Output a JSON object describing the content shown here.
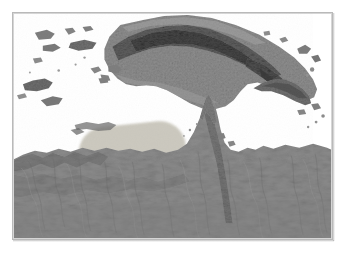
{
  "figure": {
    "type": "shaded-relief-map",
    "region_title": "New Guinea and Northern Australia",
    "projection_note": "",
    "frame": {
      "border_color": "#b9b9b9",
      "background_color": "#ffffff"
    }
  },
  "palette": {
    "sea": "#ffffff",
    "land_base": "#8e8e8e",
    "land_mid": "#7d7d7d",
    "land_dark": "#5c5c5c",
    "land_darkest": "#3f3f3f",
    "land_light": "#a3a3a3",
    "highlight_fill": "#c9c6bb",
    "frame_border": "#b9b9b9"
  },
  "highlight": {
    "name": "highlighted-study-area",
    "shape": "rounded-rectangle",
    "fill": "#c9c6bb",
    "label": "",
    "center_x": 120,
    "center_y": 138,
    "width": 108,
    "height": 52,
    "rotation_deg": -6
  },
  "features": [
    {
      "id": "new-guinea",
      "name": "New Guinea",
      "kind": "island",
      "relief": "high"
    },
    {
      "id": "new-britain",
      "name": "New Britain",
      "kind": "island",
      "relief": "medium"
    },
    {
      "id": "cape-york",
      "name": "Cape York Peninsula",
      "kind": "peninsula",
      "relief": "low"
    },
    {
      "id": "arnhem-land",
      "name": "Arnhem Land",
      "kind": "coast",
      "relief": "low"
    },
    {
      "id": "banda-islands",
      "name": "Maluku Islands",
      "kind": "island-group",
      "relief": "medium"
    },
    {
      "id": "gulf-of-carpentaria",
      "name": "Gulf of Carpentaria",
      "kind": "sea",
      "relief": "none"
    },
    {
      "id": "torres-strait",
      "name": "Torres Strait",
      "kind": "strait",
      "relief": "none"
    }
  ],
  "chart_data": {
    "type": "heatmap",
    "title": "",
    "xlabel": "",
    "ylabel": "",
    "legend": [],
    "grid": false,
    "note": "Grayscale elevation / shaded relief raster. Darker tone indicates higher terrain; white indicates ocean."
  }
}
